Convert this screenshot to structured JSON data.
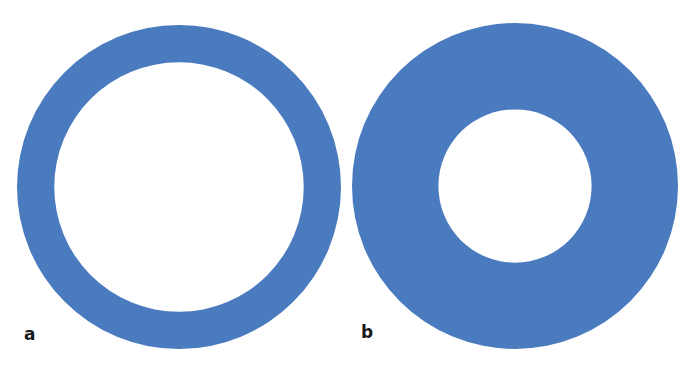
{
  "figure": {
    "panels": [
      {
        "label": "a",
        "shape": "ring",
        "inner_to_outer_radius_ratio": 0.77
      },
      {
        "label": "b",
        "shape": "ring",
        "inner_to_outer_radius_ratio": 0.47
      }
    ],
    "colors": {
      "ring_fill": "#4a7bbf",
      "background": "#ffffff",
      "label_text": "#1a1a1a"
    }
  }
}
